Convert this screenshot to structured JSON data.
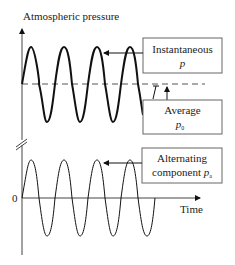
{
  "diagram": {
    "y_axis_label": "Atmospheric pressure",
    "x_axis_label": "Time",
    "zero_label": "0",
    "boxes": {
      "instantaneous": {
        "line1": "Instantaneous",
        "symbol": "p"
      },
      "average": {
        "line1": "Average",
        "symbol": "p",
        "subscript": "0"
      },
      "alternating": {
        "line1": "Alternating",
        "line2": "component",
        "symbol": "p",
        "subscript": "a"
      }
    },
    "colors": {
      "line": "#111111",
      "dashed": "#555555",
      "box_border": "#666666"
    }
  }
}
